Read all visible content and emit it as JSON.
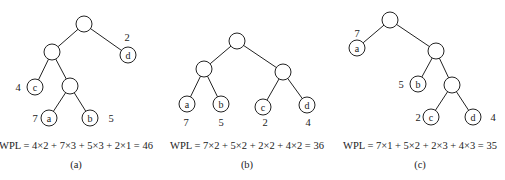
{
  "trees": [
    {
      "id": "a",
      "caption": "(a)",
      "formula": "WPL = 4×2 + 7×3 + 5×3 + 2×1 = 46",
      "leaves": [
        {
          "label": "c",
          "weight": "4",
          "depth": 2
        },
        {
          "label": "a",
          "weight": "7",
          "depth": 3
        },
        {
          "label": "b",
          "weight": "5",
          "depth": 3
        },
        {
          "label": "d",
          "weight": "2",
          "depth": 1
        }
      ],
      "wpl": 46
    },
    {
      "id": "b",
      "caption": "(b)",
      "formula": "WPL = 7×2 + 5×2 + 2×2 + 4×2 = 36",
      "leaves": [
        {
          "label": "a",
          "weight": "7",
          "depth": 2
        },
        {
          "label": "b",
          "weight": "5",
          "depth": 2
        },
        {
          "label": "c",
          "weight": "2",
          "depth": 2
        },
        {
          "label": "d",
          "weight": "4",
          "depth": 2
        }
      ],
      "wpl": 36
    },
    {
      "id": "c",
      "caption": "(c)",
      "formula": "WPL = 7×1 + 5×2 + 2×3 + 4×3 = 35",
      "leaves": [
        {
          "label": "a",
          "weight": "7",
          "depth": 1
        },
        {
          "label": "b",
          "weight": "5",
          "depth": 2
        },
        {
          "label": "c",
          "weight": "2",
          "depth": 3
        },
        {
          "label": "d",
          "weight": "4",
          "depth": 3
        }
      ],
      "wpl": 35
    }
  ]
}
